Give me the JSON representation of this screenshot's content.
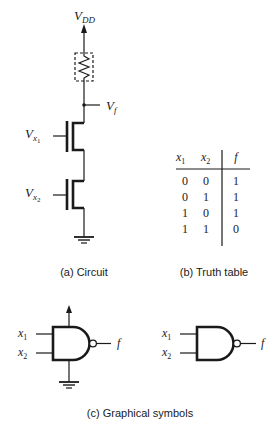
{
  "circuit": {
    "supply_label": "V",
    "supply_sub": "DD",
    "output_label": "V",
    "output_sub": "f",
    "input1_label": "V",
    "input1_sub": "x",
    "input1_subsub": "1",
    "input2_label": "V",
    "input2_sub": "x",
    "input2_subsub": "2",
    "caption": "(a) Circuit"
  },
  "truth_table": {
    "headers": [
      "x",
      "x",
      "f"
    ],
    "header_subs": [
      "1",
      "2",
      ""
    ],
    "rows": [
      [
        "0",
        "0",
        "1"
      ],
      [
        "0",
        "1",
        "1"
      ],
      [
        "1",
        "0",
        "1"
      ],
      [
        "1",
        "1",
        "0"
      ]
    ],
    "caption": "(b) Truth table"
  },
  "symbols": {
    "input1": "x",
    "input1_sub": "1",
    "input2": "x",
    "input2_sub": "2",
    "output": "f",
    "caption": "(c) Graphical symbols"
  }
}
